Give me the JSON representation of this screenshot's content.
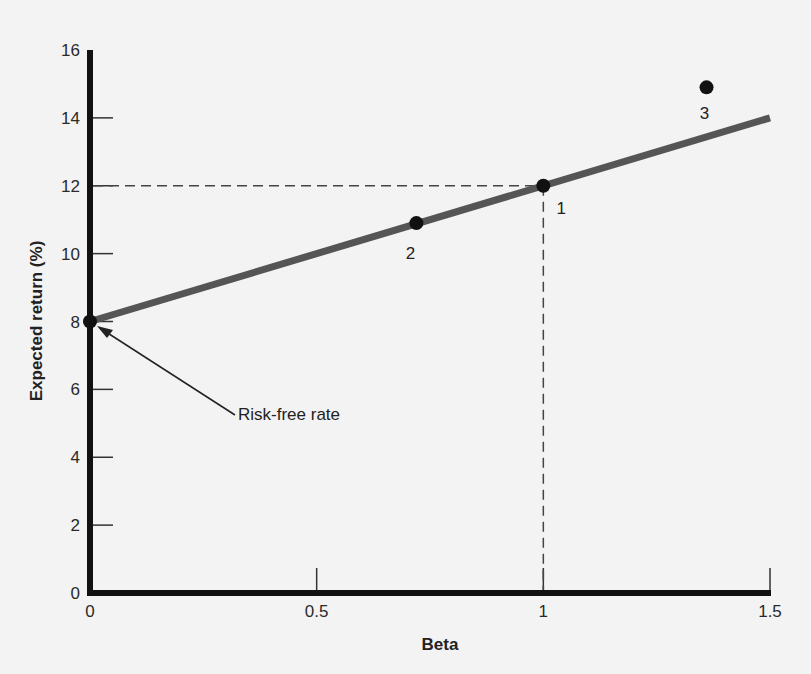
{
  "chart_data": {
    "type": "line",
    "title": "",
    "xlabel": "Beta",
    "ylabel": "Expected return (%)",
    "xlim": [
      0,
      1.5
    ],
    "ylim": [
      0,
      16
    ],
    "x_ticks": [
      "0",
      "0.5",
      "1",
      "1.5"
    ],
    "y_ticks": [
      "0",
      "2",
      "4",
      "6",
      "8",
      "10",
      "12",
      "14",
      "16"
    ],
    "grid": false,
    "legend": null,
    "series": [
      {
        "name": "Security market line",
        "type": "line",
        "x": [
          0,
          1.5
        ],
        "y": [
          8,
          14
        ],
        "color": "#555555"
      },
      {
        "name": "Points",
        "type": "scatter",
        "points": [
          {
            "label": "1",
            "x": 1.0,
            "y": 12
          },
          {
            "label": "2",
            "x": 0.72,
            "y": 10.9
          },
          {
            "label": "3",
            "x": 1.36,
            "y": 14.9
          }
        ],
        "color": "#111111"
      }
    ],
    "risk_free": {
      "x": 0,
      "y": 8
    },
    "reference_lines": [
      {
        "type": "horizontal-dashed",
        "y": 12,
        "from_x": 0,
        "to_x": 1
      },
      {
        "type": "vertical-dashed",
        "x": 1,
        "from_y": 0,
        "to_y": 12
      }
    ],
    "annotations": [
      {
        "text": "Risk-free rate",
        "points_to": {
          "x": 0,
          "y": 8
        }
      }
    ]
  }
}
